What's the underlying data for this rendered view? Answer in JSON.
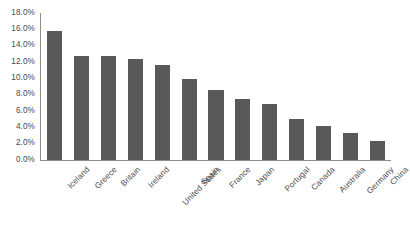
{
  "chart_data": {
    "type": "bar",
    "title": "",
    "subtitle": "",
    "xlabel": "",
    "ylabel": "",
    "categories": [
      "Iceland",
      "Greece",
      "Britain",
      "Ireland",
      "United States",
      "Spain",
      "France",
      "Japan",
      "Portugal",
      "Canada",
      "Australia",
      "Germany",
      "China"
    ],
    "values": [
      15.8,
      12.7,
      12.7,
      12.4,
      11.6,
      9.9,
      8.6,
      7.5,
      6.8,
      5.0,
      4.2,
      3.3,
      2.3
    ],
    "series": [
      {
        "name": "",
        "values": [
          15.8,
          12.7,
          12.7,
          12.4,
          11.6,
          9.9,
          8.6,
          7.5,
          6.8,
          5.0,
          4.2,
          3.3,
          2.3
        ]
      }
    ],
    "ylim": [
      0,
      18
    ],
    "ytick_step": 2,
    "ytick_labels": [
      "0.0%",
      "2.0%",
      "4.0%",
      "6.0%",
      "8.0%",
      "10.0%",
      "12.0%",
      "14.0%",
      "16.0%",
      "18.0%"
    ],
    "ytick_values": [
      0,
      2,
      4,
      6,
      8,
      10,
      12,
      14,
      16,
      18
    ],
    "value_format": "percent",
    "grid": false,
    "legend": false,
    "legend_position": "none",
    "bar_color": "#595959",
    "axis_color": "#8c8c8c",
    "text_color": "#4a4a4a",
    "background_color": "#ffffff",
    "xtick_label_rotation": -45
  }
}
